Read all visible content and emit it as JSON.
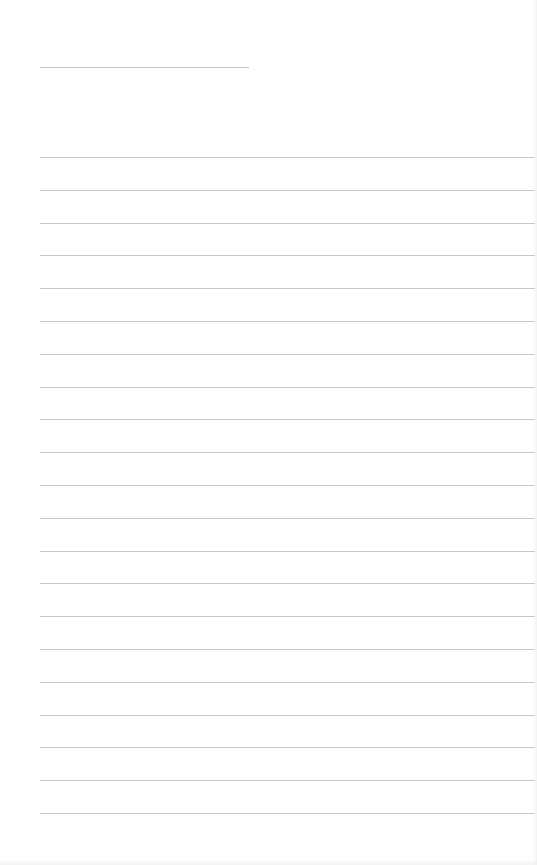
{
  "page": {
    "type": "lined-notepaper",
    "background": "#ffffff",
    "line_color": "#c8c8c8",
    "header_line": {
      "x": 40,
      "y": 67,
      "width": 209
    },
    "ruled_lines": {
      "count": 21,
      "start_y": 157,
      "spacing": 32.8,
      "left_x": 40
    }
  }
}
